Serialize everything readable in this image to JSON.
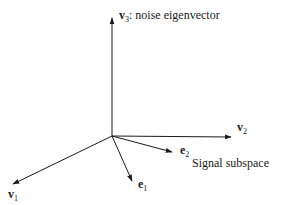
{
  "diagram": {
    "type": "vector-space",
    "origin": [
      112,
      136
    ],
    "axes": [
      {
        "id": "v3",
        "tip": [
          112,
          18
        ],
        "label_bold": "v",
        "label_sub": "3",
        "label_suffix": ": noise eigenvector",
        "label_pos": [
          119,
          19
        ]
      },
      {
        "id": "v2",
        "tip": [
          231,
          137
        ],
        "label_bold": "v",
        "label_sub": "2",
        "label_suffix": "",
        "label_pos": [
          237,
          131
        ]
      },
      {
        "id": "v1",
        "tip": [
          13,
          184
        ],
        "label_bold": "v",
        "label_sub": "1",
        "label_suffix": "",
        "label_pos": [
          8,
          198
        ]
      }
    ],
    "vectors": [
      {
        "id": "e2",
        "tip": [
          172,
          152
        ],
        "label_bold": "e",
        "label_sub": "2",
        "label_pos": [
          180,
          154
        ]
      },
      {
        "id": "e1",
        "tip": [
          132,
          181
        ],
        "label_bold": "e",
        "label_sub": "1",
        "label_pos": [
          138,
          188
        ]
      }
    ],
    "annotation": {
      "text": "Signal subspace",
      "pos": [
        192,
        167
      ]
    },
    "colors": {
      "stroke": "#1a1a1a",
      "background": "#ffffff"
    }
  }
}
